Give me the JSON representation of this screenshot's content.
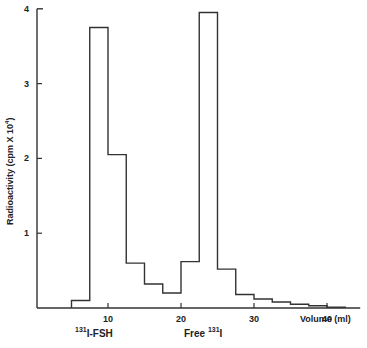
{
  "chart_data": {
    "type": "bar",
    "style": "step-histogram",
    "title": "",
    "xlabel": "Volume (ml)",
    "ylabel": "Radioactivity (cpm × 10⁴)",
    "ylabel_parts": {
      "main": "Radioactivity",
      "unit": "(cpm X 10",
      "exp": "4",
      "close": ")"
    },
    "xlim": [
      0,
      44
    ],
    "ylim": [
      0,
      4
    ],
    "xticks": [
      10,
      20,
      30,
      40
    ],
    "yticks": [
      1,
      2,
      3,
      4
    ],
    "grid": false,
    "bin_edges": [
      5,
      7.5,
      10,
      12.5,
      15,
      17.5,
      20,
      22.5,
      25,
      27.5,
      30,
      32.5,
      35,
      37.5,
      40,
      42.5
    ],
    "values": [
      0.1,
      3.75,
      2.05,
      0.6,
      0.32,
      0.2,
      0.62,
      3.95,
      0.52,
      0.18,
      0.12,
      0.08,
      0.05,
      0.03,
      0.01
    ],
    "annotations": [
      {
        "text": "I-FSH",
        "superscript": "131",
        "x": 10,
        "position": "below-axis"
      },
      {
        "text": "Free ",
        "superscript": "131",
        "suffix": "I",
        "x": 20,
        "position": "below-axis"
      }
    ]
  },
  "labels": {
    "xlabel": "Volume  (ml)",
    "ann1_sup": "131",
    "ann1_text": "I-FSH",
    "ann2_text": "Free ",
    "ann2_sup": "131",
    "ann2_suffix": "I",
    "ylabel_main": "Radioactivity  (cpm X 10",
    "ylabel_exp": "4",
    "ylabel_close": ")"
  }
}
